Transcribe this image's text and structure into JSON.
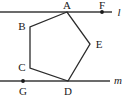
{
  "figure": {
    "width": 129,
    "height": 103,
    "background_color": "#ffffff",
    "stroke_color": "#3a3a3a",
    "polygon_stroke_color": "#2b2b2b",
    "label_color": "#1a1a1a"
  },
  "lines": [
    {
      "name": "l",
      "label": "l",
      "label_x": 119,
      "label_y": 16,
      "x1": 0,
      "y1": 12,
      "x2": 112,
      "y2": 12
    },
    {
      "name": "m",
      "label": "m",
      "label_x": 118,
      "label_y": 84,
      "x1": 0,
      "y1": 81,
      "x2": 110,
      "y2": 81
    }
  ],
  "polygon": {
    "name": "ABCDE",
    "points": "67,12 30,27 30,68 68,81 90,44",
    "vertices": [
      {
        "label": "A",
        "x": 67,
        "y": 12,
        "label_x": 67,
        "label_y": 9
      },
      {
        "label": "B",
        "x": 30,
        "y": 27,
        "label_x": 22,
        "label_y": 30
      },
      {
        "label": "C",
        "x": 30,
        "y": 68,
        "label_x": 22,
        "label_y": 71
      },
      {
        "label": "D",
        "x": 68,
        "y": 81,
        "label_x": 68,
        "label_y": 95
      },
      {
        "label": "E",
        "x": 90,
        "y": 44,
        "label_x": 99,
        "label_y": 48
      }
    ]
  },
  "points": [
    {
      "label": "F",
      "x": 102,
      "y": 12,
      "label_x": 102,
      "label_y": 9,
      "on_line": "l"
    },
    {
      "label": "G",
      "x": 23,
      "y": 81,
      "label_x": 23,
      "label_y": 95,
      "on_line": "m"
    }
  ]
}
